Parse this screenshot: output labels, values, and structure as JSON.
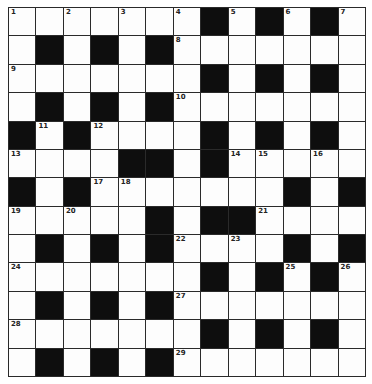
{
  "puzzle": {
    "rows": 13,
    "cols": 13,
    "colors": {
      "white": "#fdfdfd",
      "black": "#0e0e0e",
      "line": "#2a2a2a"
    },
    "layout": [
      "WWWWWWWBWBWBW",
      "WBWBWBWWWWWWW",
      "WWWWWWWBWBWBW",
      "WBWBWBWWWWWWW",
      "BWBWWWWBWBWBW",
      "WWWWBBWBWWWWW",
      "BWBWWWWWWWBWB",
      "WWWWWBWBBWWWW",
      "WBWBWBWWWWBWB",
      "WWWWWWWBWBWBW",
      "WBWBWBWWWWWWW",
      "WWWWWWWBWBWBW",
      "WBWBWBWWWWWWW"
    ],
    "numbers": [
      {
        "r": 0,
        "c": 0,
        "n": "1"
      },
      {
        "r": 0,
        "c": 2,
        "n": "2"
      },
      {
        "r": 0,
        "c": 4,
        "n": "3"
      },
      {
        "r": 0,
        "c": 6,
        "n": "4"
      },
      {
        "r": 0,
        "c": 8,
        "n": "5"
      },
      {
        "r": 0,
        "c": 10,
        "n": "6"
      },
      {
        "r": 0,
        "c": 12,
        "n": "7"
      },
      {
        "r": 1,
        "c": 6,
        "n": "8"
      },
      {
        "r": 2,
        "c": 0,
        "n": "9"
      },
      {
        "r": 3,
        "c": 6,
        "n": "10"
      },
      {
        "r": 4,
        "c": 1,
        "n": "11"
      },
      {
        "r": 4,
        "c": 3,
        "n": "12"
      },
      {
        "r": 5,
        "c": 0,
        "n": "13"
      },
      {
        "r": 5,
        "c": 8,
        "n": "14"
      },
      {
        "r": 5,
        "c": 9,
        "n": "15"
      },
      {
        "r": 5,
        "c": 11,
        "n": "16"
      },
      {
        "r": 6,
        "c": 3,
        "n": "17"
      },
      {
        "r": 6,
        "c": 4,
        "n": "18"
      },
      {
        "r": 7,
        "c": 0,
        "n": "19"
      },
      {
        "r": 7,
        "c": 2,
        "n": "20"
      },
      {
        "r": 7,
        "c": 9,
        "n": "21"
      },
      {
        "r": 8,
        "c": 6,
        "n": "22"
      },
      {
        "r": 8,
        "c": 8,
        "n": "23"
      },
      {
        "r": 9,
        "c": 0,
        "n": "24"
      },
      {
        "r": 9,
        "c": 10,
        "n": "25"
      },
      {
        "r": 9,
        "c": 12,
        "n": "26"
      },
      {
        "r": 10,
        "c": 6,
        "n": "27"
      },
      {
        "r": 11,
        "c": 0,
        "n": "28"
      },
      {
        "r": 12,
        "c": 6,
        "n": "29"
      }
    ]
  }
}
